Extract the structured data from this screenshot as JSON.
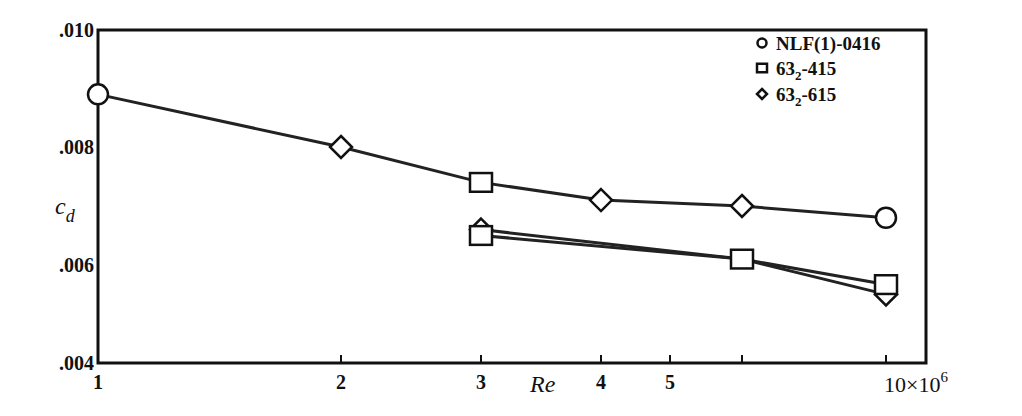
{
  "chart_data": {
    "type": "line",
    "title": "",
    "xlabel": "Re",
    "ylabel": "c_d",
    "x_scale": "log",
    "x_multiplier_label": "10×10",
    "x_multiplier_exp": "6",
    "xlim": [
      1,
      11.5
    ],
    "ylim": [
      0.004,
      0.01
    ],
    "grid": false,
    "legend_position": "upper right",
    "x_ticks": [
      {
        "value": 1,
        "label": "1",
        "px": 98
      },
      {
        "value": 2,
        "label": "2",
        "px": 341
      },
      {
        "value": 3,
        "label": "3",
        "px": 481
      },
      {
        "value": 4,
        "label": "4",
        "px": 601
      },
      {
        "value": 5,
        "label": "5",
        "px": 670
      },
      {
        "value": 7,
        "label": "",
        "px": 742
      },
      {
        "value": 10,
        "label": "10",
        "px": 886
      }
    ],
    "y_ticks": [
      {
        "value": 0.01,
        "label": ".010",
        "px": 30
      },
      {
        "value": 0.008,
        "label": ".008",
        "px": 147
      },
      {
        "value": 0.006,
        "label": ".006",
        "px": 265
      },
      {
        "value": 0.004,
        "label": ".004",
        "px": 363
      }
    ],
    "legend": [
      {
        "marker": "circle",
        "label": "NLF(1)-0416",
        "base": "NLF(1)-0416",
        "sub": ""
      },
      {
        "marker": "square",
        "label": "63_2-415",
        "base": "63",
        "sub": "2",
        "rest": "-415"
      },
      {
        "marker": "diamond",
        "label": "63_2-615",
        "base": "63",
        "sub": "2",
        "rest": "-615"
      }
    ],
    "series": [
      {
        "name": "upper curve",
        "points": [
          {
            "x": 1,
            "y": 0.0089,
            "marker": "circle"
          },
          {
            "x": 2,
            "y": 0.008,
            "marker": "diamond"
          },
          {
            "x": 3,
            "y": 0.0074,
            "marker": "square"
          },
          {
            "x": 4,
            "y": 0.0071,
            "marker": "diamond"
          },
          {
            "x": 7,
            "y": 0.007,
            "marker": "diamond"
          },
          {
            "x": 10,
            "y": 0.0068,
            "marker": "circle"
          }
        ]
      },
      {
        "name": "63_2-615",
        "points": [
          {
            "x": 3,
            "y": 0.0066,
            "marker": "diamond"
          },
          {
            "x": 7,
            "y": 0.0061,
            "marker": "none"
          },
          {
            "x": 10,
            "y": 0.0054,
            "marker": "diamond"
          }
        ]
      },
      {
        "name": "63_2-415",
        "points": [
          {
            "x": 3,
            "y": 0.0065,
            "marker": "square"
          },
          {
            "x": 7,
            "y": 0.0061,
            "marker": "square"
          },
          {
            "x": 10,
            "y": 0.0056,
            "marker": "square"
          }
        ]
      }
    ]
  },
  "plot_area": {
    "left": 98,
    "top": 30,
    "right": 926,
    "bottom": 363
  },
  "labels": {
    "y_title_main": "c",
    "y_title_sub": "d",
    "x_title": "Re"
  }
}
